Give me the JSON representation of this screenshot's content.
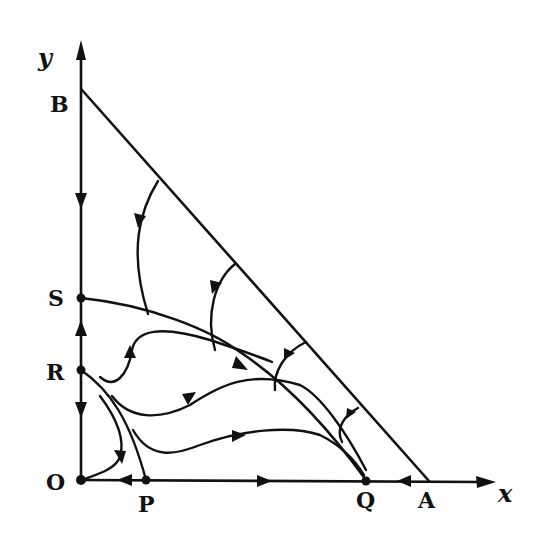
{
  "diagram": {
    "type": "phase-portrait",
    "colors": {
      "ink": "#111111",
      "background": "#ffffff"
    },
    "axes": {
      "x_label": "x",
      "y_label": "y"
    },
    "points": [
      {
        "id": "O",
        "label": "O"
      },
      {
        "id": "P",
        "label": "P"
      },
      {
        "id": "Q",
        "label": "Q"
      },
      {
        "id": "A",
        "label": "A"
      },
      {
        "id": "R",
        "label": "R"
      },
      {
        "id": "S",
        "label": "S"
      },
      {
        "id": "B",
        "label": "B"
      }
    ],
    "lines": [
      {
        "id": "AB",
        "description": "straight line from B on y-axis to A on x-axis"
      }
    ],
    "trajectories_description": "Flow arrows: on y-axis, B down to S, R up to S, R down to O; on x-axis, O right toward Q, P left to O, A left to Q; trajectories from line AB curve down onto separatrix S→Q; trajectories near R sweep toward Q; orbits from R go to O."
  }
}
